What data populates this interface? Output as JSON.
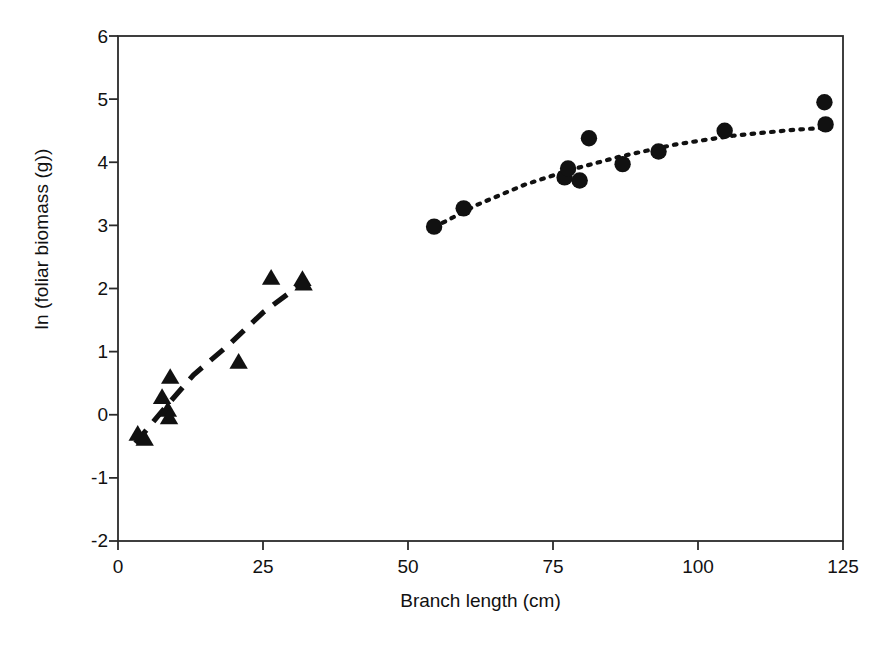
{
  "chart_data": {
    "type": "scatter",
    "title": "",
    "xlabel": "Branch length (cm)",
    "ylabel": "ln (foliar biomass (g))",
    "xlim": [
      0,
      125
    ],
    "ylim": [
      -2,
      6
    ],
    "xticks": [
      "0",
      "25",
      "50",
      "75",
      "100",
      "125"
    ],
    "xtick_values": [
      0,
      25,
      50,
      75,
      100,
      125
    ],
    "yticks": [
      "6",
      "5",
      "4",
      "3",
      "2",
      "1",
      "0",
      "-1",
      "-2"
    ],
    "ytick_values": [
      6,
      5,
      4,
      3,
      2,
      1,
      0,
      -1,
      -2
    ],
    "grid": false,
    "legend": "none",
    "series": [
      {
        "name": "triangles",
        "marker": "triangle",
        "color": "#111111",
        "fit_line_style": "dashed",
        "points": [
          {
            "x": 3.4,
            "y": -0.3
          },
          {
            "x": 4.6,
            "y": -0.38
          },
          {
            "x": 7.6,
            "y": 0.28
          },
          {
            "x": 8.6,
            "y": 0.08
          },
          {
            "x": 8.8,
            "y": -0.04
          },
          {
            "x": 9.0,
            "y": 0.6
          },
          {
            "x": 20.8,
            "y": 0.84
          },
          {
            "x": 26.4,
            "y": 2.17
          },
          {
            "x": 31.8,
            "y": 2.15
          },
          {
            "x": 32.0,
            "y": 2.08
          }
        ],
        "fit_curve": [
          {
            "x": 3.0,
            "y": -0.45
          },
          {
            "x": 8.0,
            "y": 0.1
          },
          {
            "x": 13.0,
            "y": 0.63
          },
          {
            "x": 19.0,
            "y": 1.1
          },
          {
            "x": 25.0,
            "y": 1.62
          },
          {
            "x": 32.0,
            "y": 2.1
          }
        ]
      },
      {
        "name": "circles",
        "marker": "circle",
        "color": "#111111",
        "fit_line_style": "dotted",
        "points": [
          {
            "x": 54.5,
            "y": 2.98
          },
          {
            "x": 59.6,
            "y": 3.27
          },
          {
            "x": 77.0,
            "y": 3.76
          },
          {
            "x": 77.6,
            "y": 3.9
          },
          {
            "x": 79.6,
            "y": 3.71
          },
          {
            "x": 81.2,
            "y": 4.38
          },
          {
            "x": 87.0,
            "y": 3.97
          },
          {
            "x": 93.2,
            "y": 4.17
          },
          {
            "x": 104.6,
            "y": 4.5
          },
          {
            "x": 121.8,
            "y": 4.95
          },
          {
            "x": 122.0,
            "y": 4.6
          }
        ],
        "fit_curve": [
          {
            "x": 54.5,
            "y": 2.97
          },
          {
            "x": 62.0,
            "y": 3.33
          },
          {
            "x": 70.0,
            "y": 3.64
          },
          {
            "x": 78.0,
            "y": 3.88
          },
          {
            "x": 87.0,
            "y": 4.1
          },
          {
            "x": 96.0,
            "y": 4.28
          },
          {
            "x": 106.0,
            "y": 4.42
          },
          {
            "x": 116.0,
            "y": 4.51
          },
          {
            "x": 122.5,
            "y": 4.55
          }
        ]
      }
    ]
  },
  "axes": {
    "frame_color": "#2b2b2b",
    "marker_color": "#111111"
  }
}
